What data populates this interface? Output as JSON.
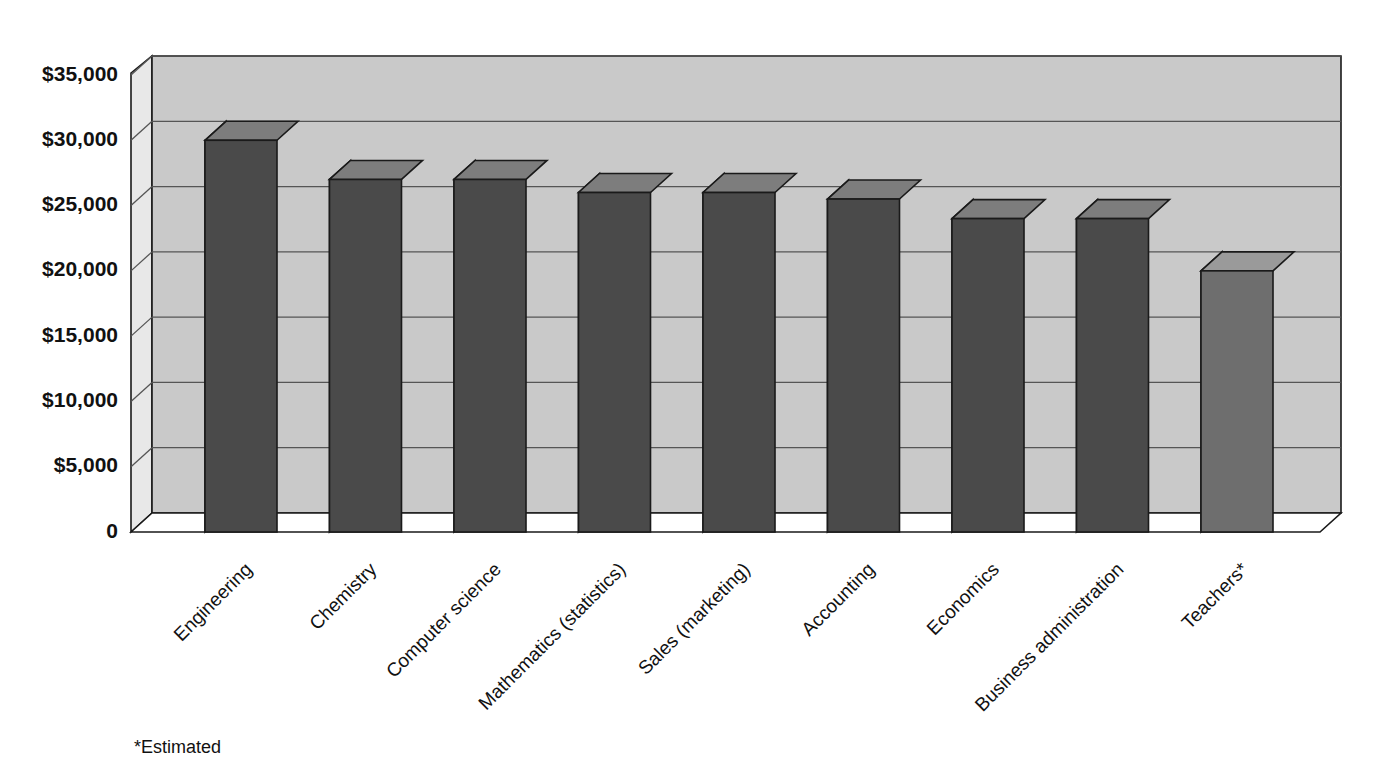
{
  "chart_data": {
    "type": "bar",
    "title": "",
    "subtitle": "",
    "xlabel": "",
    "ylabel": "",
    "ylim": [
      0,
      35000
    ],
    "ytick_values": [
      0,
      5000,
      10000,
      15000,
      20000,
      25000,
      30000,
      35000
    ],
    "ytick_labels": [
      "0",
      "$5,000",
      "$10,000",
      "$15,000",
      "$20,000",
      "$25,000",
      "$30,000",
      "$35,000"
    ],
    "grid": true,
    "legend": "none",
    "style": "3d-bar",
    "categories": [
      "Engineering",
      "Chemistry",
      "Computer science",
      "Mathematics (statistics)",
      "Sales (marketing)",
      "Accounting",
      "Economics",
      "Business administration",
      "Teachers*"
    ],
    "values": [
      30000,
      27000,
      27000,
      26000,
      26000,
      25500,
      24000,
      24000,
      20000
    ],
    "series": [
      {
        "name": "Average starting salary",
        "values": [
          30000,
          27000,
          27000,
          26000,
          26000,
          25500,
          24000,
          24000,
          20000
        ]
      }
    ],
    "annotations": [
      "*Estimated"
    ],
    "footnote": "*Estimated",
    "colors": {
      "bar_front": "#4a4a4a",
      "bar_front_last": "#6e6e6e",
      "bar_side": "#9b9b9b",
      "bar_top": "#7d7d7d",
      "bar_top_last": "#9a9a9a",
      "bar_outline": "#1a1a1a",
      "wall_back": "#c9c9c9",
      "wall_left": "#e8e8e8",
      "floor": "#ffffff",
      "gridline": "#555555",
      "text": "#111111",
      "background": "#ffffff"
    }
  },
  "footnote": {
    "text": "*Estimated"
  }
}
